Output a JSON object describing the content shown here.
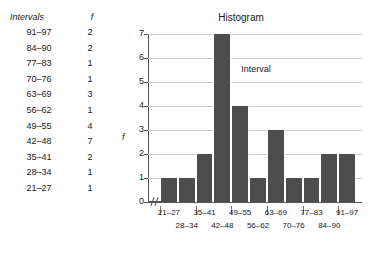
{
  "table": {
    "headers": {
      "intervals": "Intervals",
      "frequency": "f"
    },
    "rows": [
      {
        "interval": "91–97",
        "f": "2"
      },
      {
        "interval": "84–90",
        "f": "2"
      },
      {
        "interval": "77–83",
        "f": "1"
      },
      {
        "interval": "70–76",
        "f": "1"
      },
      {
        "interval": "63–69",
        "f": "3"
      },
      {
        "interval": "56–62",
        "f": "1"
      },
      {
        "interval": "49–55",
        "f": "4"
      },
      {
        "interval": "42–48",
        "f": "7"
      },
      {
        "interval": "35–41",
        "f": "2"
      },
      {
        "interval": "28–34",
        "f": "1"
      },
      {
        "interval": "21–27",
        "f": "1"
      }
    ]
  },
  "chart_data": {
    "type": "bar",
    "title": "Histogram",
    "xlabel": "Interval",
    "ylabel": "f",
    "categories": [
      "21–27",
      "28–34",
      "35–41",
      "42–48",
      "49–55",
      "56–62",
      "63–69",
      "70–76",
      "77–83",
      "84–90",
      "91–97"
    ],
    "values": [
      1,
      1,
      2,
      7,
      4,
      1,
      3,
      1,
      1,
      2,
      2
    ],
    "yticks": [
      "0",
      "1",
      "2",
      "3",
      "4",
      "5",
      "6",
      "7"
    ],
    "ylim": [
      0,
      7
    ],
    "grid": true,
    "legend": "none",
    "axis_break": "∕∕",
    "bar_color": "#4d4d4d",
    "grid_color": "#c9c9c9",
    "axis_color": "#555555"
  }
}
